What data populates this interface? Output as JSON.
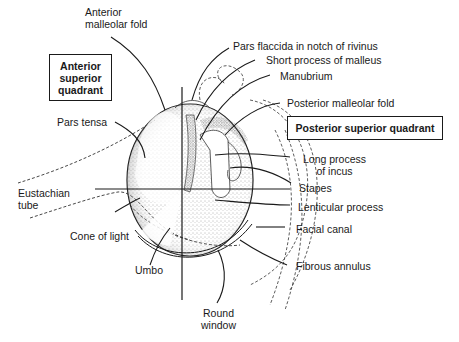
{
  "diagram": {
    "quadrant_boxes": {
      "anterior_superior": [
        "Anterior",
        "superior",
        "quadrant"
      ],
      "posterior_superior": "Posterior superior quadrant"
    },
    "labels": {
      "anterior_malleolar_fold": [
        "Anterior",
        "malleolar fold"
      ],
      "pars_flaccida": "Pars flaccida in notch of rivinus",
      "short_process": "Short process of malleus",
      "manubrium": "Manubrium",
      "posterior_malleolar_fold": "Posterior malleolar fold",
      "pars_tensa": "Pars tensa",
      "long_process_incus": [
        "Long process",
        "of incus"
      ],
      "stapes": "Stapes",
      "eustachian_tube": [
        "Eustachian",
        "tube"
      ],
      "lenticular_process": "Lenticular process",
      "facial_canal": "Facial canal",
      "cone_of_light": "Cone of light",
      "fibrous_annulus": "Fibrous annulus",
      "umbo": "Umbo",
      "round_window": [
        "Round",
        "window"
      ]
    },
    "colors": {
      "ink": "#1a1a1a",
      "stipple": "#6a6a6a",
      "background": "#ffffff"
    }
  }
}
